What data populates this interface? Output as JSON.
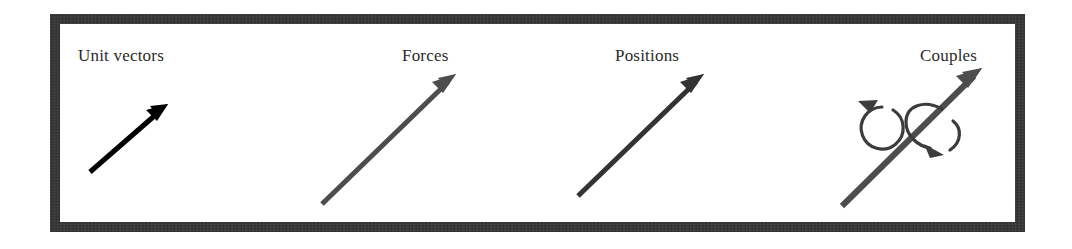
{
  "figure": {
    "background_color": "#ffffff",
    "frame_color": "#2b2b2b",
    "frame_border_width_px": 10,
    "panels": [
      {
        "id": "unit-vectors",
        "label": "Unit vectors",
        "arrow": {
          "kind": "straight-arrow",
          "color": "#000000",
          "stroke_width": 5,
          "tail": [
            30,
            148
          ],
          "tip": [
            108,
            80
          ],
          "head_length": 22,
          "head_width": 11
        },
        "curls": []
      },
      {
        "id": "forces",
        "label": "Forces",
        "arrow": {
          "kind": "straight-arrow",
          "color": "#4d4d4d",
          "stroke_width": 5,
          "tail": [
            12,
            180
          ],
          "tip": [
            146,
            50
          ],
          "head_length": 26,
          "head_width": 11
        },
        "curls": []
      },
      {
        "id": "positions",
        "label": "Positions",
        "arrow": {
          "kind": "straight-arrow",
          "color": "#333333",
          "stroke_width": 5,
          "tail": [
            18,
            172
          ],
          "tip": [
            144,
            50
          ],
          "head_length": 26,
          "head_width": 11
        },
        "curls": []
      },
      {
        "id": "couples",
        "label": "Couples",
        "arrow": {
          "kind": "straight-arrow",
          "color": "#4d4d4d",
          "stroke_width": 6,
          "tail": [
            22,
            182
          ],
          "tip": [
            162,
            44
          ],
          "head_length": 28,
          "head_width": 12
        },
        "curls": [
          {
            "id": "free-rotation-curl",
            "kind": "circular-arrow",
            "direction": "counterclockwise",
            "color": "#3c3c3c",
            "stroke_width": 3,
            "center": [
              55,
              100
            ],
            "radius": 21
          },
          {
            "id": "vector-wrap-curl",
            "kind": "loop-around-vector",
            "direction": "clockwise-about-axis",
            "color": "#3c3c3c",
            "stroke_width": 3,
            "center": [
              110,
              104
            ],
            "radius": 19
          }
        ]
      }
    ]
  }
}
